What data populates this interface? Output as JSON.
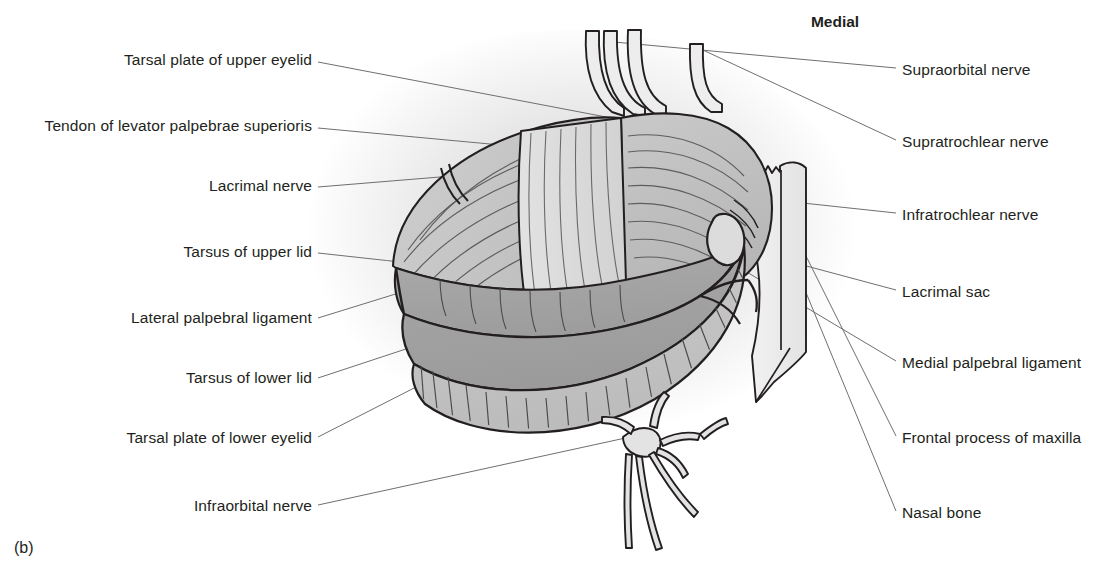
{
  "figure": {
    "panel_label": "(b)",
    "orientation_header": "Medial",
    "background_color": "#ffffff",
    "ink_color": "#231f20",
    "leader_color": "#6f6f6f",
    "tone_light": "#d2d2d2",
    "tone_mid": "#c0c0c0",
    "tone_dark": "#a6a6a6",
    "halo_color": "#e9e9e9"
  },
  "labels_left": [
    {
      "id": "tarsal-plate-upper-eyelid",
      "text": "Tarsal plate of upper eyelid",
      "x": 312,
      "y": 60,
      "lx": 318,
      "ly": 62,
      "tx": 606,
      "ty": 117
    },
    {
      "id": "tendon-levator-palpebrae",
      "text": "Tendon of levator palpebrae superioris",
      "x": 312,
      "y": 126,
      "lx": 318,
      "ly": 128,
      "tx": 576,
      "ty": 152
    },
    {
      "id": "lacrimal-nerve",
      "text": "Lacrimal nerve",
      "x": 312,
      "y": 186,
      "lx": 318,
      "ly": 187,
      "tx": 452,
      "ty": 176
    },
    {
      "id": "tarsus-upper-lid",
      "text": "Tarsus of upper lid",
      "x": 312,
      "y": 252,
      "lx": 318,
      "ly": 253,
      "tx": 455,
      "ty": 268
    },
    {
      "id": "lateral-palpebral-ligament",
      "text": "Lateral palpebral ligament",
      "x": 312,
      "y": 318,
      "lx": 318,
      "ly": 318,
      "tx": 402,
      "ty": 292
    },
    {
      "id": "tarsus-lower-lid",
      "text": "Tarsus of lower lid",
      "x": 312,
      "y": 378,
      "lx": 318,
      "ly": 378,
      "tx": 418,
      "ty": 345
    },
    {
      "id": "tarsal-plate-lower-eyelid",
      "text": "Tarsal plate of lower eyelid",
      "x": 312,
      "y": 438,
      "lx": 318,
      "ly": 437,
      "tx": 420,
      "ty": 385
    },
    {
      "id": "infraorbital-nerve",
      "text": "Infraorbital nerve",
      "x": 312,
      "y": 506,
      "lx": 318,
      "ly": 505,
      "tx": 630,
      "ty": 437
    }
  ],
  "labels_right": [
    {
      "id": "supraorbital-nerve",
      "text": "Supraorbital nerve",
      "x": 902,
      "y": 70,
      "lx": 896,
      "ly": 68,
      "tx": 614,
      "ty": 42
    },
    {
      "id": "supratrochlear-nerve",
      "text": "Supratrochlear nerve",
      "x": 902,
      "y": 142,
      "lx": 896,
      "ly": 140,
      "tx": 690,
      "ty": 44
    },
    {
      "id": "infratrochlear-nerve",
      "text": "Infratrochlear nerve",
      "x": 902,
      "y": 215,
      "lx": 896,
      "ly": 213,
      "tx": 700,
      "ty": 192
    },
    {
      "id": "lacrimal-sac",
      "text": "Lacrimal sac",
      "x": 902,
      "y": 292,
      "lx": 896,
      "ly": 290,
      "tx": 728,
      "ty": 245
    },
    {
      "id": "medial-palpebral-ligament",
      "text": "Medial palpebral ligament",
      "x": 902,
      "y": 363,
      "lx": 896,
      "ly": 361,
      "tx": 740,
      "ty": 268
    },
    {
      "id": "frontal-process-maxilla",
      "text": "Frontal process of maxilla",
      "x": 902,
      "y": 438,
      "lx": 896,
      "ly": 436,
      "tx": 776,
      "ty": 196
    },
    {
      "id": "nasal-bone",
      "text": "Nasal bone",
      "x": 902,
      "y": 513,
      "lx": 896,
      "ly": 511,
      "tx": 800,
      "ty": 278
    }
  ],
  "orientation": {
    "text": "Medial",
    "x": 835,
    "y": 14
  }
}
